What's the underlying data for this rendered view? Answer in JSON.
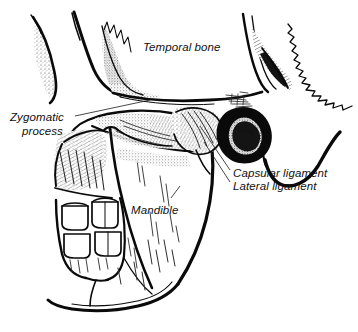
{
  "figure": {
    "background_color": "#ffffff",
    "ink_color": "#0a0a0a",
    "width": 358,
    "height": 332
  },
  "labels": {
    "temporal_bone": "Temporal bone",
    "zygomatic_process_line1": "Zygomatic",
    "zygomatic_process_line2": "process",
    "capsular_ligament": "Capsular ligament",
    "lateral_ligament": "Lateral ligament",
    "mandible": "Mandible"
  },
  "structures": [
    {
      "name": "temporal-bone",
      "label": "Temporal bone"
    },
    {
      "name": "zygomatic-process",
      "label": "Zygomatic process"
    },
    {
      "name": "capsular-ligament",
      "label": "Capsular ligament"
    },
    {
      "name": "lateral-ligament",
      "label": "Lateral ligament"
    },
    {
      "name": "mandible",
      "label": "Mandible"
    },
    {
      "name": "external-auditory-meatus",
      "label": ""
    },
    {
      "name": "molar-teeth",
      "label": ""
    },
    {
      "name": "cranial-suture",
      "label": ""
    }
  ]
}
